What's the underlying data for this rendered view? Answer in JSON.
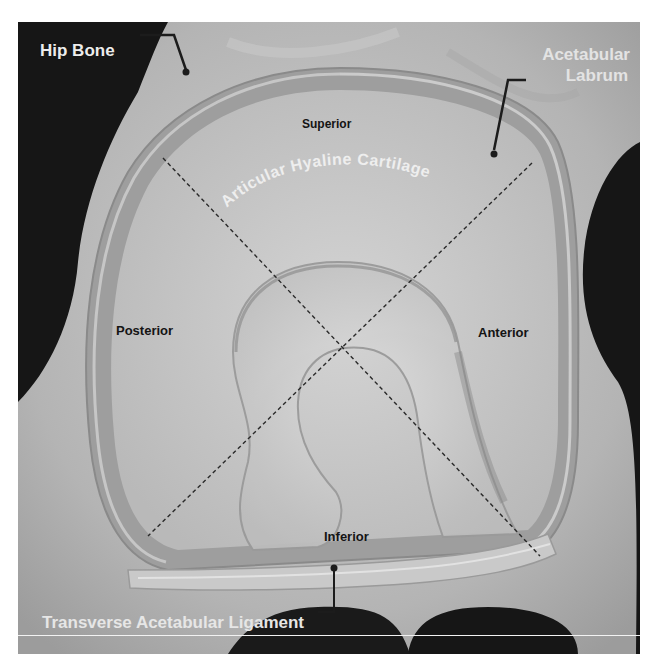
{
  "figure": {
    "labels": {
      "hip_bone": "Hip Bone",
      "acetabular_labrum_line1": "Acetabular",
      "acetabular_labrum_line2": "Labrum",
      "articular_hyaline_cartilage": "Articular Hyaline Cartilage",
      "superior": "Superior",
      "posterior": "Posterior",
      "anterior": "Anterior",
      "inferior": "Inferior",
      "transverse_acetabular_ligament": "Transverse Acetabular Ligament"
    },
    "colors": {
      "background_dark": "#151515",
      "bone": "#bdbdbd",
      "labrum": "#a6a6a6",
      "cartilage": "#c4c4c4",
      "fossa": "#cfcfcf",
      "light_label": "#ececec",
      "dark_label": "#141414",
      "dashed_line": "#2a2a2a"
    }
  }
}
